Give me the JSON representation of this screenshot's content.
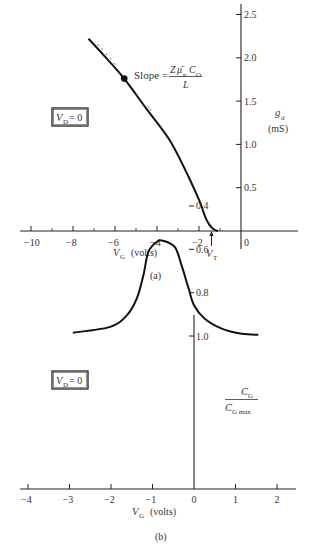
{
  "chart_data": [
    {
      "id": "a",
      "type": "line",
      "caption": "(a)",
      "xlabel": "V_G (volts)",
      "xlabel_main": "V",
      "xlabel_sub": "G",
      "xlabel_unit": "(volts)",
      "ylabel": "g_d (mS)",
      "ylabel_main": "g",
      "ylabel_sub": "d",
      "ylabel_unit": "(mS)",
      "xlim": [
        -11,
        2.7
      ],
      "ylim": [
        0,
        2.6
      ],
      "xticks": [
        -10,
        -8,
        -6,
        -4,
        -2,
        0
      ],
      "xtick_labels": [
        "−10",
        "−8",
        "−6",
        "−4",
        "−2",
        "0"
      ],
      "xminor_ticks": [
        -9,
        -7,
        -5,
        -3,
        -1
      ],
      "yticks": [
        0.5,
        1.0,
        1.5,
        2.0,
        2.5
      ],
      "ytick_labels": [
        "0.5",
        "1.0",
        "1.5",
        "2.0",
        "2.5"
      ],
      "grid": false,
      "series": [
        {
          "name": "g_d vs V_G",
          "x": [
            -7.26,
            -6.5,
            -5.56,
            -4.5,
            -3.4,
            -2.45,
            -1.95,
            -1.7,
            -1.5,
            -1.3,
            -1.1
          ],
          "y": [
            2.22,
            2.02,
            1.76,
            1.41,
            1.05,
            0.6,
            0.33,
            0.16,
            0.07,
            0.02,
            0.0
          ]
        }
      ],
      "annotations": {
        "box_text_main": "V",
        "box_text_sub": "D",
        "box_text_rest": " = 0",
        "slope_label": "Slope =",
        "slope_numerator_z": "Z",
        "slope_numerator_mu": "μ̄",
        "slope_numerator_mu_sub": "n",
        "slope_numerator_c": "C",
        "slope_numerator_c_sub": "O",
        "slope_denominator": "L",
        "slope_point": {
          "x": -5.56,
          "y": 1.76
        },
        "threshold_label_main": "V",
        "threshold_label_sub": "T",
        "threshold_x": -1.5
      }
    },
    {
      "id": "b",
      "type": "line",
      "caption": "(b)",
      "xlabel": "V_G (volts)",
      "xlabel_main": "V",
      "xlabel_sub": "G",
      "xlabel_unit": "(volts)",
      "ylabel": "C_G / C_G max",
      "ylabel_num_main": "C",
      "ylabel_num_sub": "G",
      "ylabel_den_main": "C",
      "ylabel_den_sub": "G max",
      "xlim": [
        -4.2,
        2.5
      ],
      "ylim": [
        0.3,
        1.1
      ],
      "xticks": [
        -4,
        -3,
        -2,
        -1,
        0,
        1,
        2
      ],
      "xtick_labels": [
        "−4",
        "−3",
        "−2",
        "−1",
        "0",
        "1",
        "2"
      ],
      "yticks": [
        0.4,
        0.6,
        0.8,
        1.0
      ],
      "ytick_labels": [
        "0.4",
        "0.6",
        "0.8",
        "1.0"
      ],
      "grid": false,
      "series": [
        {
          "name": "C_G/C_Gmax vs V_G",
          "x": [
            -2.92,
            -2.02,
            -1.62,
            -1.38,
            -1.22,
            -1.1,
            -0.9,
            -0.75,
            -0.46,
            -0.3,
            -0.14,
            0.0,
            0.26,
            0.67,
            1.15,
            1.55
          ],
          "y": [
            0.985,
            0.958,
            0.905,
            0.828,
            0.72,
            0.612,
            0.566,
            0.56,
            0.59,
            0.674,
            0.774,
            0.858,
            0.92,
            0.966,
            0.99,
            0.994
          ]
        }
      ],
      "annotations": {
        "box_text_main": "V",
        "box_text_sub": "D",
        "box_text_rest": " = 0"
      }
    }
  ]
}
